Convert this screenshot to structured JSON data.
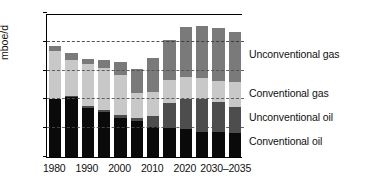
{
  "chart_data": {
    "type": "bar",
    "stacked": true,
    "title": "",
    "subtitle": "",
    "xlabel": "",
    "ylabel": "mboe/d",
    "ylim": [
      0,
      25
    ],
    "yticks": [
      0,
      5,
      10,
      15,
      20,
      25
    ],
    "ytick_labels": [
      "0",
      "5",
      "10",
      "15",
      "20",
      "25"
    ],
    "grid": "horizontal dashed gridlines at 5, 10, 15, 20",
    "legend_position": "right, aligned to final bar segments",
    "categories": [
      "1980",
      "1985",
      "1990",
      "1995",
      "2000",
      "2005",
      "2010",
      "2015",
      "2020",
      "2025",
      "2030",
      "2035"
    ],
    "xtick_labels": [
      "1980",
      "1990",
      "2000",
      "2010",
      "2020",
      "2030–2035"
    ],
    "xtick_positions": [
      0,
      2,
      4,
      6,
      8,
      10.5
    ],
    "series": [
      {
        "name": "Conventional oil",
        "color": "#0a0a0a",
        "values": [
          10.0,
          10.4,
          8.5,
          7.9,
          6.8,
          6.3,
          5.2,
          5.0,
          4.8,
          4.4,
          4.3,
          4.2
        ]
      },
      {
        "name": "Unconventional oil",
        "color": "#4d4d4d",
        "values": [
          0.1,
          0.2,
          0.3,
          0.3,
          0.5,
          0.5,
          1.9,
          4.3,
          5.3,
          5.7,
          5.2,
          4.4
        ]
      },
      {
        "name": "Conventional gas",
        "color": "#c8c8c8",
        "values": [
          8.3,
          6.2,
          7.3,
          7.3,
          6.9,
          4.4,
          4.2,
          4.1,
          3.8,
          3.6,
          3.7,
          4.4
        ]
      },
      {
        "name": "Unconventional gas",
        "color": "#7a7a7a",
        "values": [
          0.9,
          1.3,
          1.0,
          1.4,
          2.3,
          4.0,
          5.9,
          7.0,
          8.7,
          9.1,
          9.2,
          8.7
        ]
      }
    ],
    "totals": [
      19.3,
      18.1,
      17.1,
      16.9,
      16.5,
      15.2,
      17.2,
      20.4,
      22.6,
      22.8,
      22.4,
      21.7
    ]
  },
  "legend": {
    "items": [
      {
        "label": "Unconventional gas",
        "color": "#7a7a7a"
      },
      {
        "label": "Conventional gas",
        "color": "#c8c8c8"
      },
      {
        "label": "Unconventional oil",
        "color": "#4d4d4d"
      },
      {
        "label": "Conventional oil",
        "color": "#0a0a0a"
      }
    ]
  },
  "axis": {
    "y_title": "mboe/d"
  }
}
